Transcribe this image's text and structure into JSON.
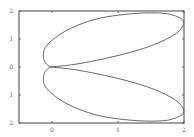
{
  "chart_data": {
    "type": "line",
    "title": "",
    "xlabel": "",
    "ylabel": "",
    "xlim": [
      -0.5,
      2
    ],
    "ylim": [
      -2,
      2
    ],
    "grid": false,
    "legend": null,
    "x_ticks": [
      {
        "value": 0,
        "label": "0"
      },
      {
        "value": 1,
        "label": "1"
      },
      {
        "value": 2,
        "label": "2"
      }
    ],
    "y_ticks": [
      {
        "value": 2,
        "label": "2"
      },
      {
        "value": 1,
        "label": "1"
      },
      {
        "value": 0,
        "label": "0"
      },
      {
        "value": -1,
        "label": "1"
      },
      {
        "value": -2,
        "label": "2"
      }
    ],
    "series": [
      {
        "name": "upper-lobe",
        "color": "#555555",
        "points": [
          [
            -0.03,
            0
          ],
          [
            -0.1,
            0.15
          ],
          [
            -0.13,
            0.4
          ],
          [
            -0.1,
            0.7
          ],
          [
            0.05,
            1.05
          ],
          [
            0.3,
            1.4
          ],
          [
            0.65,
            1.7
          ],
          [
            1.0,
            1.85
          ],
          [
            1.4,
            1.93
          ],
          [
            1.75,
            1.9
          ],
          [
            1.97,
            1.7
          ],
          [
            1.98,
            1.45
          ],
          [
            1.85,
            1.15
          ],
          [
            1.55,
            0.8
          ],
          [
            1.15,
            0.5
          ],
          [
            0.7,
            0.25
          ],
          [
            0.3,
            0.08
          ],
          [
            -0.03,
            0
          ]
        ]
      },
      {
        "name": "lower-lobe",
        "color": "#555555",
        "points": [
          [
            -0.03,
            0
          ],
          [
            -0.1,
            -0.15
          ],
          [
            -0.13,
            -0.4
          ],
          [
            -0.1,
            -0.7
          ],
          [
            0.05,
            -1.05
          ],
          [
            0.3,
            -1.4
          ],
          [
            0.65,
            -1.7
          ],
          [
            1.0,
            -1.85
          ],
          [
            1.4,
            -1.93
          ],
          [
            1.75,
            -1.9
          ],
          [
            1.97,
            -1.7
          ],
          [
            1.98,
            -1.45
          ],
          [
            1.85,
            -1.15
          ],
          [
            1.55,
            -0.8
          ],
          [
            1.15,
            -0.5
          ],
          [
            0.7,
            -0.25
          ],
          [
            0.3,
            -0.08
          ],
          [
            -0.03,
            0
          ]
        ]
      }
    ]
  },
  "plot_area": {
    "left": 19,
    "top": 11,
    "right": 184,
    "bottom": 123
  }
}
